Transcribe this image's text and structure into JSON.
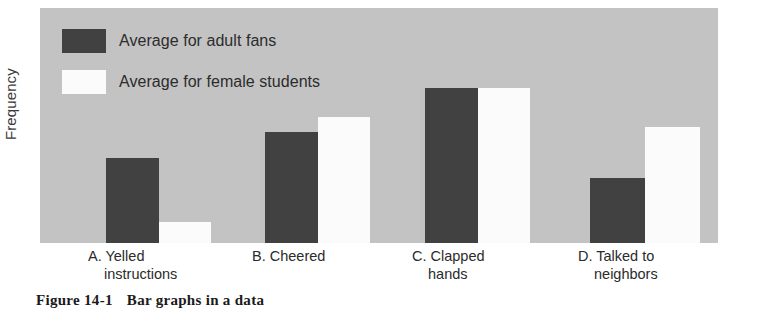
{
  "chart_data": {
    "type": "bar",
    "title": "",
    "xlabel": "",
    "ylabel": "Frequency",
    "grid": false,
    "legend_position": "top-left-inside",
    "categories": [
      "A. Yelled instructions",
      "B. Cheered",
      "C. Clapped hands",
      "D. Talked to neighbors"
    ],
    "category_lines": [
      [
        "A. Yelled",
        "instructions"
      ],
      [
        "B. Cheered",
        ""
      ],
      [
        "C. Clapped",
        "hands"
      ],
      [
        "D. Talked to",
        "neighbors"
      ]
    ],
    "series": [
      {
        "name": "Average for adult fans",
        "color": "#414141",
        "values": [
          85,
          111,
          155,
          65
        ]
      },
      {
        "name": "Average for female students",
        "color": "#fbfbfb",
        "values": [
          21,
          126,
          155,
          116
        ]
      }
    ],
    "ylim": [
      0,
      235
    ],
    "y_ticks_shown": false,
    "plot_background": "#c3c3c3",
    "page_background": "#ffffff"
  },
  "legend": {
    "items": [
      {
        "label": "Average for adult fans",
        "swatch": "dark"
      },
      {
        "label": "Average for female students",
        "swatch": "light"
      }
    ]
  },
  "caption": {
    "figure_number": "Figure 14-1",
    "text": "Bar graphs in a data"
  }
}
